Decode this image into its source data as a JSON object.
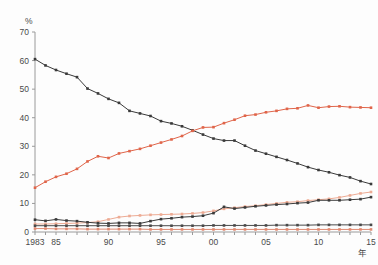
{
  "axis": {
    "y_unit_label": "%",
    "x_unit_label": "年",
    "y_ticks": [
      "0",
      "10",
      "20",
      "30",
      "40",
      "50",
      "60",
      "70"
    ],
    "x_ticks": [
      {
        "label": "1983",
        "year": 1983
      },
      {
        "label": "85",
        "year": 1985
      },
      {
        "label": "90",
        "year": 1990
      },
      {
        "label": "95",
        "year": 1995
      },
      {
        "label": "00",
        "year": 2000
      },
      {
        "label": "05",
        "year": 2005
      },
      {
        "label": "10",
        "year": 2010
      },
      {
        "label": "15",
        "year": 2015
      }
    ]
  },
  "colors": {
    "series_declining_black": "#3a3a3a",
    "series_rising_orange": "#e0654a",
    "series_rising_salmon": "#edab94",
    "series_rising_black": "#3a3a3a",
    "series_flat_black": "#4a4a4a",
    "series_flat_orange": "#e08a72",
    "axis": "#9a9a9a",
    "text": "#4a4a4a",
    "background": "#fdfdfd"
  },
  "chart_data": {
    "type": "line",
    "title": "",
    "xlabel": "年",
    "ylabel": "%",
    "xlim": [
      1983,
      2015
    ],
    "ylim": [
      0,
      70
    ],
    "grid": false,
    "legend": "none",
    "markers": "square",
    "x": [
      1983,
      1984,
      1985,
      1986,
      1987,
      1988,
      1989,
      1990,
      1991,
      1992,
      1993,
      1994,
      1995,
      1996,
      1997,
      1998,
      1999,
      2000,
      2001,
      2002,
      2003,
      2004,
      2005,
      2006,
      2007,
      2008,
      2009,
      2010,
      2011,
      2012,
      2013,
      2014,
      2015
    ],
    "series": [
      {
        "name": "series-1-declining-black",
        "color": "#3a3a3a",
        "values": [
          60.5,
          58.3,
          56.7,
          55.4,
          54.2,
          50.2,
          48.5,
          46.6,
          45.2,
          42.4,
          41.5,
          40.6,
          38.8,
          38.0,
          37.0,
          35.6,
          34.1,
          32.7,
          32.0,
          32.0,
          30.2,
          28.5,
          27.4,
          26.3,
          25.2,
          24.0,
          22.7,
          21.7,
          20.9,
          19.9,
          19.1,
          17.8,
          16.8
        ]
      },
      {
        "name": "series-2-rising-orange",
        "color": "#e0654a",
        "values": [
          15.5,
          17.6,
          19.3,
          20.4,
          22.1,
          24.7,
          26.5,
          25.9,
          27.5,
          28.3,
          29.1,
          30.2,
          31.3,
          32.4,
          33.6,
          35.4,
          36.6,
          36.7,
          38.1,
          39.3,
          40.7,
          41.1,
          41.9,
          42.4,
          43.1,
          43.3,
          44.3,
          43.5,
          43.9,
          44.0,
          43.7,
          43.6,
          43.5
        ]
      },
      {
        "name": "series-3-rising-salmon",
        "color": "#edab94",
        "values": [
          2.8,
          2.8,
          2.9,
          3.0,
          3.1,
          3.3,
          3.6,
          4.4,
          5.2,
          5.6,
          5.8,
          6.0,
          6.1,
          6.2,
          6.3,
          6.5,
          6.8,
          7.4,
          8.1,
          8.5,
          8.9,
          9.2,
          9.6,
          10.0,
          10.4,
          10.6,
          11.0,
          11.3,
          11.6,
          12.1,
          12.8,
          13.5,
          14.0
        ]
      },
      {
        "name": "series-4-rising-black",
        "color": "#3a3a3a",
        "values": [
          4.3,
          3.9,
          4.4,
          4.0,
          3.8,
          3.4,
          3.1,
          3.0,
          3.2,
          3.2,
          3.0,
          3.8,
          4.5,
          4.8,
          5.2,
          5.4,
          5.7,
          6.6,
          8.8,
          8.2,
          8.6,
          9.0,
          9.3,
          9.6,
          9.8,
          10.1,
          10.3,
          11.1,
          11.1,
          11.1,
          11.3,
          11.5,
          12.2
        ]
      },
      {
        "name": "series-5-flat-black",
        "color": "#4a4a4a",
        "values": [
          2.2,
          2.2,
          2.2,
          2.2,
          2.2,
          2.2,
          2.2,
          2.2,
          2.2,
          2.2,
          2.2,
          2.2,
          2.2,
          2.2,
          2.2,
          2.2,
          2.2,
          2.3,
          2.3,
          2.3,
          2.3,
          2.3,
          2.3,
          2.4,
          2.4,
          2.4,
          2.4,
          2.5,
          2.5,
          2.5,
          2.5,
          2.5,
          2.5
        ]
      },
      {
        "name": "series-6-flat-orange",
        "color": "#e08a72",
        "values": [
          1.2,
          1.2,
          1.1,
          1.1,
          1.1,
          1.0,
          1.0,
          1.0,
          1.0,
          1.0,
          1.0,
          0.9,
          0.9,
          0.9,
          0.9,
          0.9,
          0.9,
          0.9,
          0.9,
          0.9,
          0.9,
          0.9,
          0.9,
          0.9,
          0.9,
          0.9,
          0.9,
          0.9,
          0.9,
          0.9,
          0.9,
          0.9,
          0.9
        ]
      }
    ]
  }
}
